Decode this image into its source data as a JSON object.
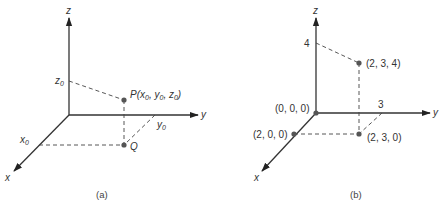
{
  "panels": [
    {
      "caption": "(a)",
      "axes": {
        "x": "x",
        "y": "y",
        "z": "z"
      },
      "axis_ticks": {
        "x": "x",
        "y": "y",
        "z": "z",
        "sub": "0"
      },
      "point_P": {
        "name": "P",
        "coords_open": "(",
        "x": "x",
        "y": "y",
        "z": "z",
        "sub": "0",
        "sep": ", ",
        "close": ")"
      },
      "point_Q": {
        "name": "Q"
      }
    },
    {
      "caption": "(b)",
      "axes": {
        "x": "x",
        "y": "y",
        "z": "z"
      },
      "z_tick": "4",
      "y_tick": "3",
      "points": [
        {
          "label": "(0, 0, 0)"
        },
        {
          "label": "(2, 0, 0)"
        },
        {
          "label": "(2, 3, 0)"
        },
        {
          "label": "(2, 3, 4)"
        }
      ]
    }
  ]
}
